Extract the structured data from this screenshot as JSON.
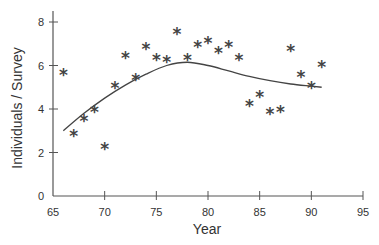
{
  "chart_data": {
    "type": "scatter",
    "title": "",
    "xlabel": "Year",
    "ylabel": "Individuals / Survey",
    "xlim": [
      65,
      95
    ],
    "ylim": [
      0,
      8.5
    ],
    "x_ticks": [
      65,
      70,
      75,
      80,
      85,
      90,
      95
    ],
    "y_ticks": [
      0,
      2,
      4,
      6,
      8
    ],
    "grid": false,
    "legend": null,
    "marker": "*",
    "series": [
      {
        "name": "observations",
        "type": "scatter",
        "x": [
          66,
          67,
          68,
          69,
          70,
          71,
          72,
          73,
          74,
          75,
          76,
          77,
          78,
          79,
          80,
          81,
          82,
          83,
          84,
          85,
          86,
          87,
          88,
          89,
          90,
          91
        ],
        "y": [
          5.6,
          2.8,
          3.5,
          3.9,
          2.2,
          5.0,
          6.4,
          5.4,
          6.8,
          6.3,
          6.2,
          7.5,
          6.3,
          6.9,
          7.1,
          6.6,
          6.9,
          6.3,
          4.2,
          4.6,
          3.8,
          3.9,
          6.7,
          5.5,
          5.0,
          6.0
        ]
      },
      {
        "name": "smoothed trend",
        "type": "line",
        "x": [
          66,
          68,
          70,
          72,
          74,
          76,
          78,
          80,
          82,
          84,
          86,
          88,
          90,
          91
        ],
        "y": [
          3.0,
          3.8,
          4.5,
          5.1,
          5.6,
          6.0,
          6.15,
          6.0,
          5.75,
          5.5,
          5.3,
          5.15,
          5.05,
          5.0
        ]
      }
    ]
  },
  "axes": {
    "x_title": "Year",
    "y_title": "Individuals / Survey",
    "x_tick_labels": [
      "65",
      "70",
      "75",
      "80",
      "85",
      "90",
      "95"
    ],
    "y_tick_labels": [
      "0",
      "2",
      "4",
      "6",
      "8"
    ]
  },
  "colors": {
    "axis": "#555555",
    "marker": "#444444",
    "line": "#444444",
    "text": "#333333"
  }
}
